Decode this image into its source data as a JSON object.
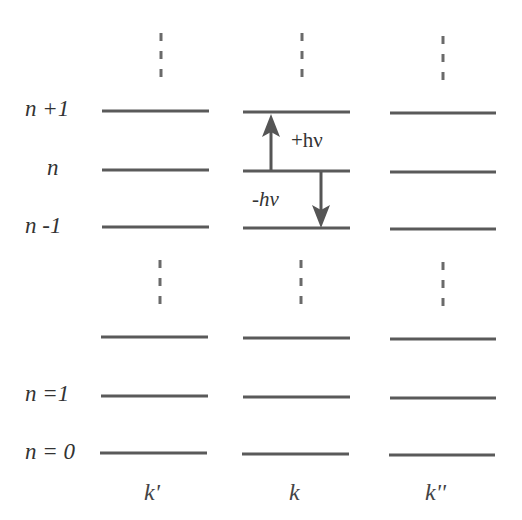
{
  "levels": {
    "n_plus_1": "n +1",
    "n": "n",
    "n_minus_1": "n -1",
    "n_eq_1": "n =1",
    "n_eq_0": "n = 0"
  },
  "columns": [
    "k'",
    "k",
    "k''"
  ],
  "transitions": {
    "absorb": "+hν",
    "emit": "-hν"
  },
  "colors": {
    "line": "#5a5a5a",
    "text": "#333333",
    "background": "#ffffff"
  }
}
